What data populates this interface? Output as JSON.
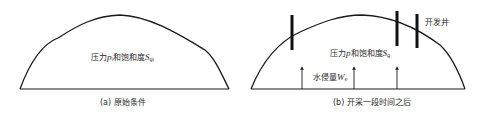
{
  "panels": [
    {
      "id": "a",
      "caption": "(a) 原始条件",
      "label": {
        "prefix": "压力",
        "var1": "p",
        "var1_sub": "i",
        "middle": "和饱和度",
        "var2": "S",
        "var2_sub": "gi"
      }
    },
    {
      "id": "b",
      "caption": "(b) 开采一段时间之后",
      "label": {
        "prefix": "压力",
        "var1": "p",
        "var1_sub": "",
        "middle": "和饱和度",
        "var2": "S",
        "var2_sub": "g"
      },
      "water_influx": {
        "prefix": "水侵量",
        "var": "W",
        "var_sub": "e"
      },
      "wells_label": "开发井",
      "well_count": 3,
      "arrow_count": 3
    }
  ],
  "colors": {
    "line": "#1a1a1a",
    "well": "#111111",
    "background": "#ffffff"
  }
}
